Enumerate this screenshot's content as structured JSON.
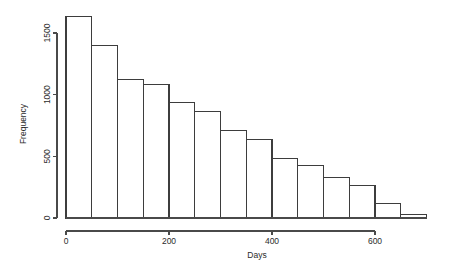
{
  "chart_data": {
    "type": "bar",
    "title": "",
    "subtitle": "",
    "xlabel": "Days",
    "ylabel": "Frequency",
    "xlim": [
      0,
      700
    ],
    "ylim": [
      0,
      1700
    ],
    "grid": false,
    "legend": null,
    "bin_width": 50,
    "bin_edges": [
      0,
      50,
      100,
      150,
      200,
      250,
      300,
      350,
      400,
      450,
      500,
      550,
      600,
      650,
      700
    ],
    "categories": [
      "0-50",
      "50-100",
      "100-150",
      "150-200",
      "200-250",
      "250-300",
      "300-350",
      "350-400",
      "400-450",
      "450-500",
      "500-550",
      "550-600",
      "600-650",
      "650-700"
    ],
    "values": [
      1630,
      1400,
      1120,
      1080,
      940,
      860,
      710,
      640,
      485,
      425,
      330,
      260,
      115,
      25
    ],
    "xticks": [
      0,
      200,
      400,
      600
    ],
    "xtick_labels": [
      "0",
      "200",
      "400",
      "600"
    ],
    "yticks": [
      0,
      500,
      1000,
      1500
    ],
    "ytick_labels": [
      "0",
      "500",
      "1000",
      "1500"
    ],
    "colors": {
      "bar_fill": "#ffffff",
      "bar_stroke": "#3d3d3d",
      "axis": "#4a4a4a",
      "text": "#2b2b2b",
      "background": "#ffffff"
    }
  }
}
